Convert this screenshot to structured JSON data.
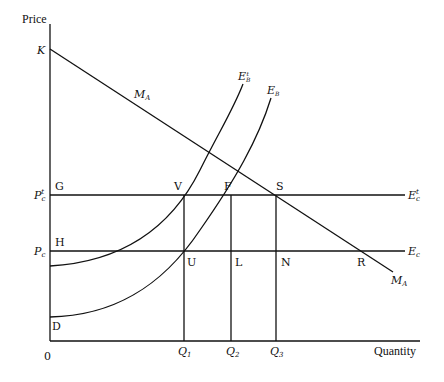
{
  "diagram": {
    "y_axis_label": "Price",
    "x_axis_label": "Quantity",
    "origin_label": "0",
    "price_labels": {
      "K": "K",
      "pc_prime": "P",
      "pc_prime_sub": "c",
      "pc_prime_sup": "t",
      "pc": "P",
      "pc_sub": "c"
    },
    "curves": {
      "ma": {
        "label": "M",
        "sub": "A"
      },
      "eb_prime": {
        "label": "E",
        "sub": "B",
        "sup": "t"
      },
      "eb": {
        "label": "E",
        "sub": "B"
      },
      "ec_prime": {
        "label": "E",
        "sub": "c",
        "sup": "t"
      },
      "ec": {
        "label": "E",
        "sub": "c"
      }
    },
    "points": {
      "G": "G",
      "H": "H",
      "D": "D",
      "V": "V",
      "F": "F",
      "S": "S",
      "U": "U",
      "L": "L",
      "N": "N",
      "R": "R"
    },
    "quantities": [
      {
        "label": "Q",
        "sub": "1"
      },
      {
        "label": "Q",
        "sub": "2"
      },
      {
        "label": "Q",
        "sub": "3"
      }
    ]
  }
}
